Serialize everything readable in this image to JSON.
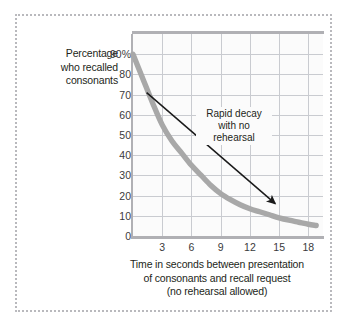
{
  "figure": {
    "frame_style": "dotted-gray-border",
    "background_color": "#ffffff",
    "plot_background_color": "#fbfbfb",
    "grid_color": "#c9cbd0",
    "axis_color": "#b0b0b4",
    "curve_color": "#a8a8a8",
    "arrow_color": "#1a1a1a",
    "text_color": "#231f20"
  },
  "chart_data": {
    "type": "line",
    "title": "",
    "subtitle": "",
    "xlabel_lines": [
      "Time in seconds between presentation",
      "of consonants and recall request",
      "(no rehearsal allowed)"
    ],
    "ylabel_lines": [
      "Percentage",
      "who recalled",
      "consonants"
    ],
    "xlim": [
      0,
      19.5
    ],
    "ylim": [
      0,
      100
    ],
    "xticks": [
      3,
      6,
      9,
      12,
      15,
      18
    ],
    "xtick_labels": [
      "3",
      "6",
      "9",
      "12",
      "15",
      "18"
    ],
    "yticks": [
      0,
      10,
      20,
      30,
      40,
      50,
      60,
      70,
      80,
      90
    ],
    "ytick_labels": [
      "0",
      "10",
      "20",
      "30",
      "40",
      "50",
      "60",
      "70",
      "80",
      "90%"
    ],
    "grid": true,
    "legend": false,
    "series": [
      {
        "name": "Percentage who recalled consonants",
        "x": [
          0,
          1,
          2,
          3,
          4,
          5,
          6,
          7,
          8,
          9,
          10,
          11,
          12,
          13,
          14,
          15,
          16,
          17,
          18,
          18.8
        ],
        "values": [
          90,
          78,
          66,
          55,
          47,
          41,
          35,
          30,
          25,
          21,
          18,
          15.5,
          13.5,
          12,
          10.5,
          9,
          7.8,
          6.8,
          5.8,
          5.2
        ]
      }
    ],
    "annotations": [
      {
        "name": "rapid-decay-note",
        "text_lines": [
          "Rapid decay",
          "with no",
          "rehearsal"
        ],
        "x_text": 5.5,
        "y_text": 63,
        "arrow_from": [
          1.4,
          71
        ],
        "arrow_to": [
          14.6,
          16
        ]
      }
    ]
  }
}
